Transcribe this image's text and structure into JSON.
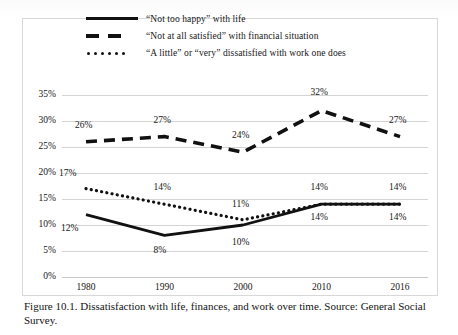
{
  "figure": {
    "caption": "Figure 10.1. Dissatisfaction with life, finances, and work over time. Source: General Social Survey."
  },
  "chart_data": {
    "type": "line",
    "title": "",
    "xlabel": "",
    "ylabel": "",
    "categories": [
      "1980",
      "1990",
      "2000",
      "2010",
      "2016"
    ],
    "ylim": [
      0,
      35
    ],
    "yticks": [
      "0%",
      "5%",
      "10%",
      "15%",
      "20%",
      "25%",
      "30%",
      "35%"
    ],
    "ytick_values": [
      0,
      5,
      10,
      15,
      20,
      25,
      30,
      35
    ],
    "grid": true,
    "legend_position": "top",
    "series": [
      {
        "name": "“Not too happy” with life",
        "style": "solid",
        "color": "#111111",
        "values": [
          12,
          8,
          10,
          14,
          14
        ],
        "labels": [
          "12%",
          "8%",
          "10%",
          "14%",
          "14%"
        ]
      },
      {
        "name": "“Not at all  satisfied” with financial  situation",
        "style": "dashed",
        "color": "#111111",
        "values": [
          26,
          27,
          24,
          32,
          27
        ],
        "labels": [
          "26%",
          "27%",
          "24%",
          "32%",
          "27%"
        ]
      },
      {
        "name": "“A little”  or “very” dissatisfied with work one does",
        "style": "dotted",
        "color": "#111111",
        "values": [
          17,
          14,
          11,
          14,
          14
        ],
        "labels": [
          "17%",
          "14%",
          "11%",
          "14%",
          "14%"
        ]
      }
    ]
  }
}
